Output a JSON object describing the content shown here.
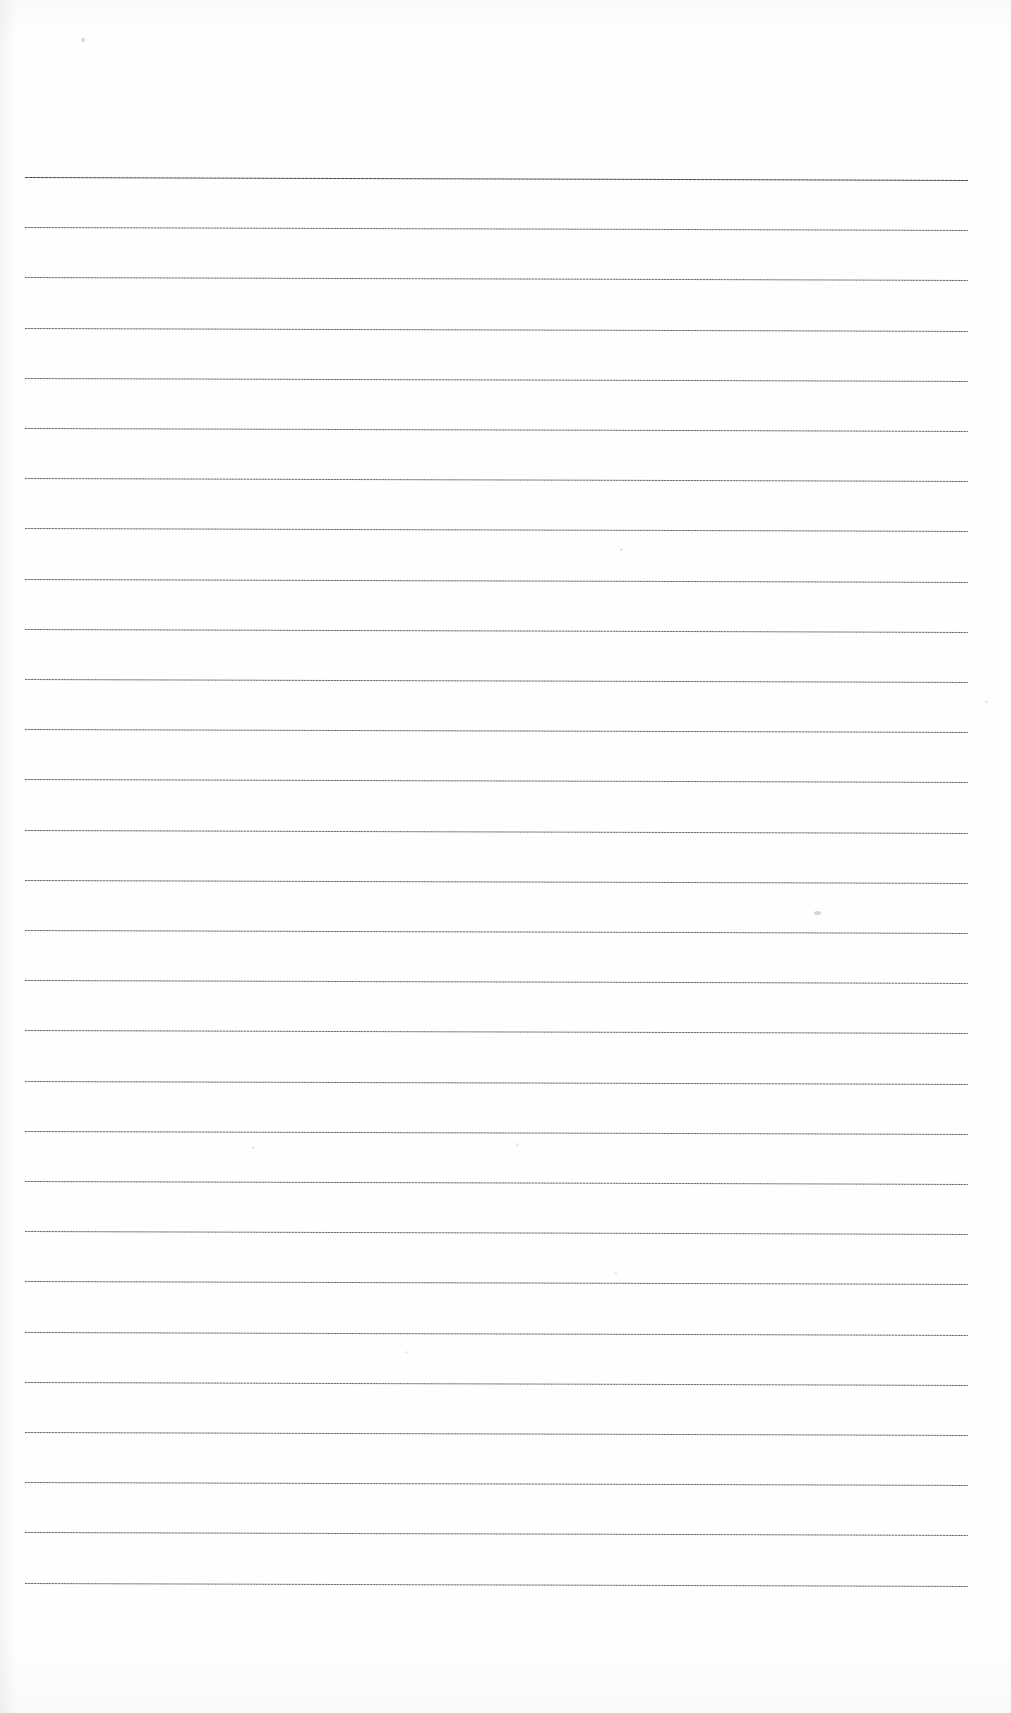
{
  "document": {
    "kind": "scanned-ruled-paper",
    "title": "Blank ruled notebook page (scan)",
    "page_width": 1011,
    "page_height": 1713,
    "paper_color": "#ffffff",
    "ink_color": "#6f7176",
    "header_rule_color": "#4a4c51",
    "visible_text": "",
    "text_content_present": false
  },
  "ruling": {
    "line_count": 29,
    "first_line_y": 177,
    "line_spacing": 50.2,
    "line_start_x": 25,
    "line_end_x": 968,
    "line_length": 943,
    "skew_degrees": 0.18,
    "top_margin": 177,
    "bottom_margin": 110,
    "left_margin": 25,
    "right_margin": 43,
    "header_rule_index": 0,
    "header_rule_label": "top-margin-rule",
    "lines": [
      {
        "index": 0,
        "y": 177,
        "weight": "heavy"
      },
      {
        "index": 1,
        "y": 227.2,
        "weight": "normal"
      },
      {
        "index": 2,
        "y": 277.4,
        "weight": "normal"
      },
      {
        "index": 3,
        "y": 327.6,
        "weight": "normal"
      },
      {
        "index": 4,
        "y": 377.8,
        "weight": "normal"
      },
      {
        "index": 5,
        "y": 428.0,
        "weight": "normal"
      },
      {
        "index": 6,
        "y": 478.2,
        "weight": "normal"
      },
      {
        "index": 7,
        "y": 528.4,
        "weight": "normal"
      },
      {
        "index": 8,
        "y": 578.6,
        "weight": "normal"
      },
      {
        "index": 9,
        "y": 628.8,
        "weight": "normal"
      },
      {
        "index": 10,
        "y": 679.0,
        "weight": "normal"
      },
      {
        "index": 11,
        "y": 729.2,
        "weight": "normal"
      },
      {
        "index": 12,
        "y": 779.4,
        "weight": "normal"
      },
      {
        "index": 13,
        "y": 829.6,
        "weight": "normal"
      },
      {
        "index": 14,
        "y": 879.8,
        "weight": "normal"
      },
      {
        "index": 15,
        "y": 930.0,
        "weight": "normal"
      },
      {
        "index": 16,
        "y": 980.2,
        "weight": "normal"
      },
      {
        "index": 17,
        "y": 1030.4,
        "weight": "normal"
      },
      {
        "index": 18,
        "y": 1080.6,
        "weight": "normal"
      },
      {
        "index": 19,
        "y": 1130.8,
        "weight": "normal"
      },
      {
        "index": 20,
        "y": 1181.0,
        "weight": "normal"
      },
      {
        "index": 21,
        "y": 1231.2,
        "weight": "normal"
      },
      {
        "index": 22,
        "y": 1281.4,
        "weight": "normal"
      },
      {
        "index": 23,
        "y": 1331.6,
        "weight": "normal"
      },
      {
        "index": 24,
        "y": 1381.8,
        "weight": "normal"
      },
      {
        "index": 25,
        "y": 1432.0,
        "weight": "normal"
      },
      {
        "index": 26,
        "y": 1482.2,
        "weight": "normal"
      },
      {
        "index": 27,
        "y": 1532.4,
        "weight": "normal"
      },
      {
        "index": 28,
        "y": 1582.6,
        "weight": "normal"
      }
    ]
  },
  "specks": [
    {
      "name": "speck-top-left",
      "x": 81,
      "y": 38,
      "w": 4,
      "h": 4,
      "color": "rgba(140,142,148,0.35)"
    },
    {
      "name": "speck-mid-right",
      "x": 814,
      "y": 911,
      "w": 7,
      "h": 4,
      "color": "rgba(150,152,158,0.40)"
    },
    {
      "name": "speck-upper-mid",
      "x": 620,
      "y": 548,
      "w": 3,
      "h": 3,
      "color": "rgba(160,162,168,0.30)"
    },
    {
      "name": "speck-mid-left",
      "x": 252,
      "y": 1146,
      "w": 3,
      "h": 3,
      "color": "rgba(160,162,168,0.28)"
    },
    {
      "name": "speck-mid-center",
      "x": 516,
      "y": 1143,
      "w": 3,
      "h": 3,
      "color": "rgba(160,162,168,0.26)"
    },
    {
      "name": "speck-lower-mid",
      "x": 614,
      "y": 1272,
      "w": 3,
      "h": 3,
      "color": "rgba(160,162,168,0.26)"
    },
    {
      "name": "speck-lower-left",
      "x": 405,
      "y": 1351,
      "w": 3,
      "h": 3,
      "color": "rgba(160,162,168,0.24)"
    },
    {
      "name": "speck-right-edge",
      "x": 985,
      "y": 700,
      "w": 3,
      "h": 3,
      "color": "rgba(160,162,168,0.22)"
    }
  ]
}
